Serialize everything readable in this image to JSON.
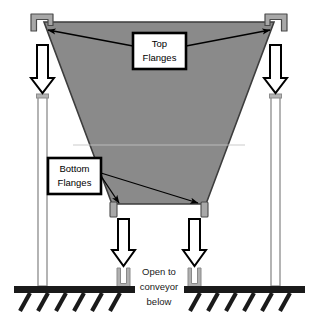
{
  "diagram": {
    "colors": {
      "hopper_fill": "#8a8a8a",
      "hopper_stroke": "#3d3d3d",
      "flange_fill": "#a8a8a8",
      "flange_stroke": "#4a4a4a",
      "leg_fill": "#ffffff",
      "leg_stroke": "#8c8c8c",
      "arrow_fill": "#ffffff",
      "arrow_stroke": "#000000",
      "ground_fill": "#1a1a1a",
      "callout_box_fill": "#ffffff",
      "callout_box_stroke": "#000000",
      "leader_stroke": "#000000",
      "seam_line": "#c9c9c9",
      "channel_fill": "#b0b0b0",
      "channel_stroke": "#8a8a8a",
      "text_color": "#000000"
    },
    "callouts": [
      {
        "id": "top-flanges",
        "line1": "Top",
        "line2": "Flanges"
      },
      {
        "id": "bottom-flanges",
        "line1": "Bottom",
        "line2": "Flanges"
      }
    ],
    "annotations": [
      {
        "id": "open-to-conveyor",
        "line1": "Open to",
        "line2": "conveyor",
        "line3": "below"
      }
    ],
    "parts": {
      "top_flange_left": "top-flange-left-hook",
      "top_flange_right": "top-flange-right-hook",
      "bottom_flange_left": "bottom-flange-left-tab",
      "bottom_flange_right": "bottom-flange-right-tab",
      "hopper": "hopper-body",
      "leg_left": "support-leg-left",
      "leg_right": "support-leg-right",
      "channel_left": "u-channel-left",
      "channel_right": "u-channel-right",
      "ground_left": "ground-hatch-left",
      "ground_right": "ground-hatch-right"
    },
    "load_arrows": [
      {
        "id": "load-arrow-outer-left"
      },
      {
        "id": "load-arrow-outer-right"
      },
      {
        "id": "load-arrow-inner-left"
      },
      {
        "id": "load-arrow-inner-right"
      }
    ]
  }
}
